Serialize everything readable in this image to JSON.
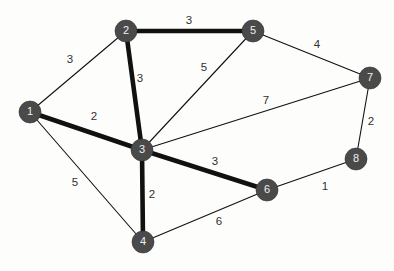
{
  "diagram": {
    "type": "node-link-graph",
    "background_color": "#fdfdfc",
    "node_color": "#4a4a4a",
    "node_label_color": "#f0f0f0",
    "edge_color": "#111111",
    "weight_label_color": "#303030",
    "node_radius": 11
  },
  "nodes": [
    {
      "id": "1",
      "label": "1",
      "x": 30,
      "y": 112
    },
    {
      "id": "2",
      "label": "2",
      "x": 126,
      "y": 31
    },
    {
      "id": "3",
      "label": "3",
      "x": 142,
      "y": 150
    },
    {
      "id": "4",
      "label": "4",
      "x": 143,
      "y": 242
    },
    {
      "id": "5",
      "label": "5",
      "x": 253,
      "y": 31
    },
    {
      "id": "6",
      "label": "6",
      "x": 267,
      "y": 190
    },
    {
      "id": "7",
      "label": "7",
      "x": 370,
      "y": 78
    },
    {
      "id": "8",
      "label": "8",
      "x": 356,
      "y": 159
    }
  ],
  "edges": [
    {
      "id": "e1-2",
      "source": "1",
      "target": "2",
      "weight": "3",
      "emphasis": "thin",
      "label_x": 70,
      "label_y": 60
    },
    {
      "id": "e1-3",
      "source": "1",
      "target": "3",
      "weight": "2",
      "emphasis": "thick",
      "label_x": 94,
      "label_y": 117
    },
    {
      "id": "e1-4",
      "source": "1",
      "target": "4",
      "weight": "5",
      "emphasis": "thin",
      "label_x": 75,
      "label_y": 183
    },
    {
      "id": "e2-3",
      "source": "2",
      "target": "3",
      "weight": "3",
      "emphasis": "thick",
      "label_x": 140,
      "label_y": 79
    },
    {
      "id": "e2-5",
      "source": "2",
      "target": "5",
      "weight": "3",
      "emphasis": "thick",
      "label_x": 189,
      "label_y": 21
    },
    {
      "id": "e3-5",
      "source": "3",
      "target": "5",
      "weight": "5",
      "emphasis": "thin",
      "label_x": 204,
      "label_y": 68
    },
    {
      "id": "e3-7",
      "source": "3",
      "target": "7",
      "weight": "7",
      "emphasis": "thin",
      "label_x": 266,
      "label_y": 101
    },
    {
      "id": "e3-6",
      "source": "3",
      "target": "6",
      "weight": "3",
      "emphasis": "thick",
      "label_x": 215,
      "label_y": 162
    },
    {
      "id": "e3-4",
      "source": "3",
      "target": "4",
      "weight": "2",
      "emphasis": "thick",
      "label_x": 152,
      "label_y": 195
    },
    {
      "id": "e4-6",
      "source": "4",
      "target": "6",
      "weight": "6",
      "emphasis": "thin",
      "label_x": 219,
      "label_y": 222
    },
    {
      "id": "e5-7",
      "source": "5",
      "target": "7",
      "weight": "4",
      "emphasis": "thin",
      "label_x": 317,
      "label_y": 45
    },
    {
      "id": "e6-8",
      "source": "6",
      "target": "8",
      "weight": "1",
      "emphasis": "thin",
      "label_x": 325,
      "label_y": 187
    },
    {
      "id": "e7-8",
      "source": "7",
      "target": "8",
      "weight": "2",
      "emphasis": "thin",
      "label_x": 371,
      "label_y": 122
    }
  ]
}
